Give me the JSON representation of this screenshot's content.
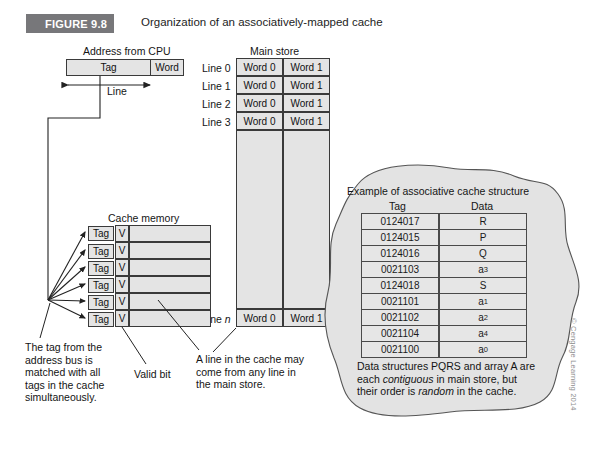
{
  "figure": {
    "badge": "FIGURE 9.8",
    "caption": "Organization of an associatively-mapped cache"
  },
  "address": {
    "title": "Address from CPU",
    "tag_label": "Tag",
    "word_label": "Word",
    "line_label": "Line"
  },
  "main_store": {
    "title": "Main store",
    "row_labels": [
      "Line 0",
      "Line 1",
      "Line 2",
      "Line 3"
    ],
    "last_row_label_prefix": "Line ",
    "last_row_label_italic": "n",
    "word0": "Word 0",
    "word1": "Word 1"
  },
  "cache": {
    "title": "Cache memory",
    "tag_label": "Tag",
    "valid_label": "V",
    "row_count": 6
  },
  "annotations": {
    "tag_match": "The tag from the address bus is matched with all tags in the cache simultaneously.",
    "valid_bit": "Valid bit",
    "line_origin": "A line in the cache may come from any line in the main store."
  },
  "assoc_example": {
    "title": "Example of associative cache structure",
    "columns": [
      "Tag",
      "Data"
    ],
    "rows": [
      {
        "tag": "0124017",
        "data": "R",
        "sub": ""
      },
      {
        "tag": "0124015",
        "data": "P",
        "sub": ""
      },
      {
        "tag": "0124016",
        "data": "Q",
        "sub": ""
      },
      {
        "tag": "0021103",
        "data": "a",
        "sub": "3"
      },
      {
        "tag": "0124018",
        "data": "S",
        "sub": ""
      },
      {
        "tag": "0021101",
        "data": "a",
        "sub": "1"
      },
      {
        "tag": "0021102",
        "data": "a",
        "sub": "2"
      },
      {
        "tag": "0021104",
        "data": "a",
        "sub": "4"
      },
      {
        "tag": "0021100",
        "data": "a",
        "sub": "0"
      }
    ],
    "footnote_parts": {
      "p1": "Data structures PQRS and array A are each ",
      "em1": "contiguous",
      "p2": " in main store, but their order is ",
      "em2": "random",
      "p3": " in the cache."
    }
  },
  "copyright": "© Cengage Learning 2014",
  "colors": {
    "badge_bg": "#77777a",
    "cell_fill": "#e4e4e4",
    "blob_fill": "#e3e3e3",
    "stroke": "#3a3a3a"
  }
}
